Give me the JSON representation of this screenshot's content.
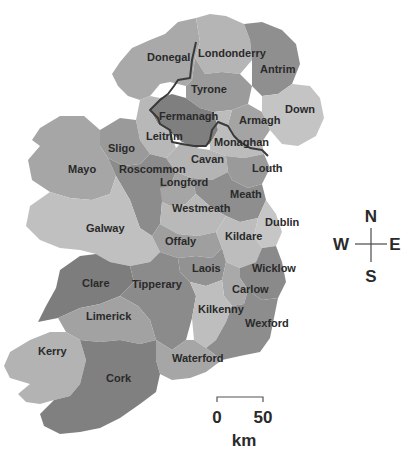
{
  "map": {
    "title": "Counties of Ireland",
    "counties": [
      {
        "name": "Donegal",
        "shade": "#a9a9a9"
      },
      {
        "name": "Londonderry",
        "shade": "#b5b5b5"
      },
      {
        "name": "Antrim",
        "shade": "#8f8f8f"
      },
      {
        "name": "Tyrone",
        "shade": "#9b9b9b"
      },
      {
        "name": "Down",
        "shade": "#c4c4c4"
      },
      {
        "name": "Fermanagh",
        "shade": "#7f7f7f"
      },
      {
        "name": "Armagh",
        "shade": "#a4a4a4"
      },
      {
        "name": "Leitrim",
        "shade": "#b8b8b8"
      },
      {
        "name": "Monaghan",
        "shade": "#bcbcbc"
      },
      {
        "name": "Sligo",
        "shade": "#9a9a9a"
      },
      {
        "name": "Cavan",
        "shade": "#b4b4b4"
      },
      {
        "name": "Mayo",
        "shade": "#a6a6a6"
      },
      {
        "name": "Roscommon",
        "shade": "#8c8c8c"
      },
      {
        "name": "Louth",
        "shade": "#9a9a9a"
      },
      {
        "name": "Longford",
        "shade": "#a5a5a5"
      },
      {
        "name": "Meath",
        "shade": "#8e8e8e"
      },
      {
        "name": "Westmeath",
        "shade": "#b9b9b9"
      },
      {
        "name": "Dublin",
        "shade": "#c6c6c6"
      },
      {
        "name": "Galway",
        "shade": "#c0c0c0"
      },
      {
        "name": "Offaly",
        "shade": "#9f9f9f"
      },
      {
        "name": "Kildare",
        "shade": "#bdbdbd"
      },
      {
        "name": "Laois",
        "shade": "#929292"
      },
      {
        "name": "Wicklow",
        "shade": "#8a8a8a"
      },
      {
        "name": "Clare",
        "shade": "#7d7d7d"
      },
      {
        "name": "Tipperary",
        "shade": "#8b8b8b"
      },
      {
        "name": "Carlow",
        "shade": "#a9a9a9"
      },
      {
        "name": "Kilkenny",
        "shade": "#bebebe"
      },
      {
        "name": "Limerick",
        "shade": "#a2a2a2"
      },
      {
        "name": "Wexford",
        "shade": "#8d8d8d"
      },
      {
        "name": "Kerry",
        "shade": "#b3b3b3"
      },
      {
        "name": "Waterford",
        "shade": "#a6a6a6"
      },
      {
        "name": "Cork",
        "shade": "#808080"
      }
    ]
  },
  "compass": {
    "north": "N",
    "south": "S",
    "east": "E",
    "west": "W"
  },
  "scale_bar": {
    "start_label": "0",
    "end_label": "50",
    "unit": "km"
  }
}
